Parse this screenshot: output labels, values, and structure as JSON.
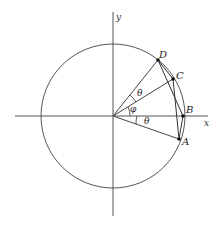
{
  "diagram": {
    "axes": {
      "x_label": "x",
      "y_label": "y"
    },
    "circle": {
      "center": "origin"
    },
    "points": [
      {
        "id": "A",
        "label": "A"
      },
      {
        "id": "B",
        "label": "B"
      },
      {
        "id": "C",
        "label": "C"
      },
      {
        "id": "D",
        "label": "D"
      }
    ],
    "angles": [
      {
        "id": "theta-lower",
        "label": "θ",
        "between": "OA and OB"
      },
      {
        "id": "phi",
        "label": "φ",
        "between": "OB and OC"
      },
      {
        "id": "theta-upper",
        "label": "θ",
        "between": "OC and OD"
      }
    ],
    "segments": [
      "OA",
      "OC",
      "OD",
      "DB",
      "CA",
      "DC",
      "BA"
    ]
  }
}
